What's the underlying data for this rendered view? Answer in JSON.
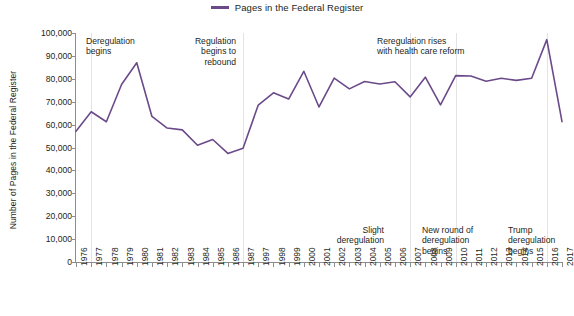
{
  "legend": {
    "label": "Pages in the Federal Register",
    "color": "#6b4a8a",
    "position": "top-center"
  },
  "axis": {
    "ylabel": "Number of Pages in the Federal Register",
    "yticks": [
      "0",
      "10,000",
      "20,000",
      "30,000",
      "40,000",
      "50,000",
      "60,000",
      "70,000",
      "80,000",
      "90,000",
      "100,000"
    ]
  },
  "annotations": {
    "deregulation_begins": "Deregulation\nbegins",
    "regulation_rebound": "Regulation\nbegins to\nrebound",
    "reregulation_health_care": "Reregulation rises\nwith health care reform",
    "slight_deregulation": "Slight\nderegulation",
    "new_round_deregulation": "New round of\nderegulation\nbegins",
    "trump_deregulation": "Trump\nderegulation\nbegins"
  },
  "chart_data": {
    "type": "line",
    "title": "",
    "xlabel": "",
    "ylabel": "Number of Pages in the Federal Register",
    "ylim": [
      0,
      100000
    ],
    "ytick_step": 10000,
    "grid": false,
    "legend_position": "top-center",
    "line_color": "#6b4a8a",
    "categories": [
      "1976",
      "1977",
      "1978",
      "1979",
      "1980",
      "1981",
      "1982",
      "1983",
      "1984",
      "1985",
      "1986",
      "1987",
      "1997",
      "1998",
      "1999",
      "2000",
      "2001",
      "2002",
      "2003",
      "2004",
      "2005",
      "2006",
      "2007",
      "2008",
      "2009",
      "2010",
      "2011",
      "2012",
      "2013",
      "2014",
      "2015",
      "2016",
      "2017"
    ],
    "values": [
      57072,
      65603,
      61261,
      77498,
      87012,
      63554,
      58494,
      57704,
      50998,
      53480,
      47418,
      49654,
      68530,
      73880,
      71161,
      83294,
      67702,
      80332,
      75606,
      78851,
      77752,
      78724,
      72090,
      80700,
      68598,
      81405,
      81247,
      78961,
      80224,
      79311,
      80260,
      97110,
      61308
    ]
  }
}
